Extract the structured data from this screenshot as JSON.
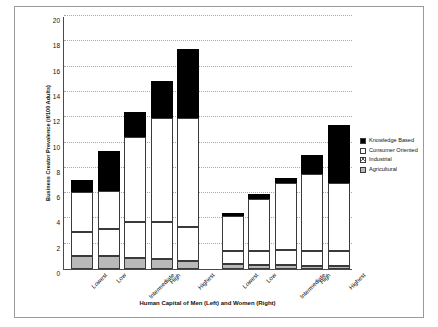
{
  "chart_data": {
    "type": "bar",
    "stacked": true,
    "title": "",
    "xlabel": "Human Capital of Men (Left) and Women (Right)",
    "ylabel": "Business Creator Prevalence (if/100 Adults)",
    "ylim": [
      0,
      20
    ],
    "yticks": [
      0,
      2,
      4,
      6,
      8,
      10,
      12,
      14,
      16,
      18,
      20
    ],
    "grid": true,
    "legend_position": "right",
    "categories": [
      "Lowest",
      "Low",
      "Intermediate",
      "High",
      "Highest",
      "Lowest",
      "Low",
      "Intermediate",
      "High",
      "Highest"
    ],
    "groups": [
      {
        "name": "Men",
        "categories": [
          "Lowest",
          "Low",
          "Intermediate",
          "High",
          "Highest"
        ]
      },
      {
        "name": "Women",
        "categories": [
          "Lowest",
          "Low",
          "Intermediate",
          "High",
          "Highest"
        ]
      }
    ],
    "series": [
      {
        "name": "Agricultural",
        "values": [
          1.0,
          1.0,
          0.9,
          0.8,
          0.6,
          0.4,
          0.3,
          0.3,
          0.2,
          0.2
        ]
      },
      {
        "name": "Industrial",
        "values": [
          1.9,
          2.2,
          2.8,
          2.9,
          2.7,
          1.0,
          1.1,
          1.2,
          1.2,
          1.2
        ]
      },
      {
        "name": "Consumer Oriented",
        "values": [
          3.2,
          3.0,
          6.7,
          8.2,
          8.6,
          2.8,
          4.1,
          5.3,
          6.1,
          5.4
        ]
      },
      {
        "name": "Knowledge Based",
        "values": [
          0.9,
          3.1,
          2.0,
          3.0,
          5.5,
          0.2,
          0.4,
          0.4,
          1.5,
          4.6
        ]
      }
    ],
    "totals": [
      7.0,
      9.3,
      12.4,
      14.9,
      17.4,
      4.4,
      5.9,
      7.2,
      9.0,
      11.4
    ]
  },
  "legend": {
    "items": [
      {
        "label": "Knowledge Based",
        "key": "kb",
        "color": "#000000"
      },
      {
        "label": "Consumer Oriented",
        "key": "co",
        "color": "#ffffff"
      },
      {
        "label": "Industrial",
        "key": "ind",
        "color": "#ffffff"
      },
      {
        "label": "Agricultural",
        "key": "agr",
        "color": "#b9b9b9"
      }
    ]
  },
  "axis": {
    "y_title": "Business Creator Prevalence (if/100 Adults)",
    "x_title": "Human Capital of Men (Left) and Women (Right)",
    "y_tick_labels": [
      "20",
      "18",
      "16",
      "14",
      "12",
      "10",
      "8",
      "6",
      "4",
      "2",
      "0"
    ],
    "x_tick_labels": [
      "Lowest",
      "Low",
      "Intermediate",
      "High",
      "Highest",
      "Lowest",
      "Low",
      "Intermediate",
      "High",
      "Highest"
    ]
  }
}
